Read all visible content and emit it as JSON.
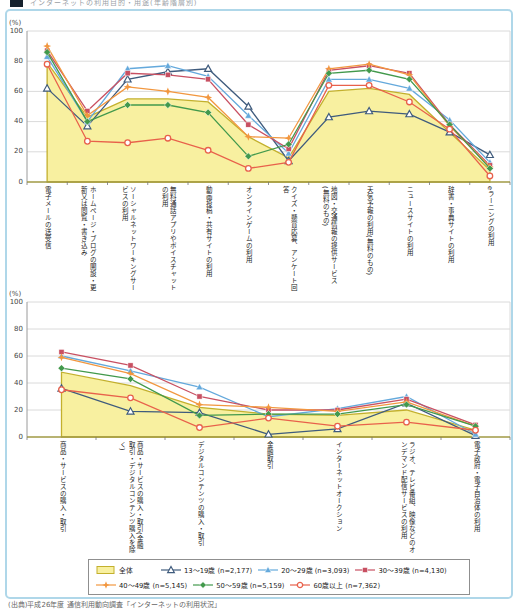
{
  "header": {
    "text": "インターネットの利用目的・用途(年齢階層別)"
  },
  "charts": {
    "percent_label": "(%)",
    "y_ticks": [
      0,
      20,
      40,
      60,
      80,
      100
    ]
  },
  "chart_data": [
    {
      "type": "area",
      "title": "インターネットの利用目的・用途(上段)",
      "ylabel": "(%)",
      "ylim": [
        0,
        100
      ],
      "grid": true,
      "categories": [
        "電子メールの送受信",
        "ホームページ・ブログの開設・更新又は閲覧・書き込み",
        "ソーシャルネットワーキングサービスの利用",
        "無料通話アプリやボイスチャットの利用",
        "動画投稿・共有サイトの利用",
        "オンラインゲームの利用",
        "クイズ・懸賞応募、アンケート回答",
        "地図・交通情報の提供サービス(無料のもの)",
        "天気予報の利用(無料のもの)",
        "ニュースサイトの利用",
        "辞書・事典サイトの利用",
        "eラーニングの利用"
      ],
      "series": [
        {
          "name": "全体",
          "marker": "area",
          "color": "#f8f0a0",
          "edge": "#c3b02d",
          "values": [
            79,
            43,
            55,
            55,
            53,
            30,
            16,
            60,
            62,
            58,
            33,
            8
          ]
        },
        {
          "name": "13〜19歳 (n=2,177)",
          "marker": "triangle-open",
          "color": "#3f5b7d",
          "values": [
            62,
            37,
            68,
            73,
            75,
            50,
            14,
            43,
            47,
            45,
            33,
            18
          ]
        },
        {
          "name": "20〜29歳 (n=3,093)",
          "marker": "triangle-filled",
          "color": "#64a9dc",
          "values": [
            83,
            40,
            75,
            77,
            70,
            44,
            19,
            68,
            68,
            62,
            41,
            13
          ]
        },
        {
          "name": "30〜39歳 (n=4,130)",
          "marker": "square-filled",
          "color": "#c85062",
          "values": [
            87,
            47,
            72,
            71,
            68,
            38,
            22,
            74,
            77,
            72,
            38,
            11
          ]
        },
        {
          "name": "40〜49歳 (n=5,145)",
          "marker": "star4",
          "color": "#f2973f",
          "values": [
            90,
            44,
            63,
            60,
            56,
            30,
            29,
            75,
            78,
            71,
            37,
            10
          ]
        },
        {
          "name": "50〜59歳 (n=5,159)",
          "marker": "diamond-filled",
          "color": "#42994c",
          "values": [
            86,
            40,
            51,
            51,
            46,
            17,
            25,
            72,
            74,
            68,
            38,
            9
          ]
        },
        {
          "name": "60歳以上 (n=7,362)",
          "marker": "circle-open",
          "color": "#e8614b",
          "values": [
            78,
            27,
            26,
            29,
            21,
            9,
            13,
            64,
            64,
            53,
            35,
            4
          ]
        }
      ]
    },
    {
      "type": "area",
      "title": "インターネットの利用目的・用途(下段)",
      "ylabel": "(%)",
      "ylim": [
        0,
        100
      ],
      "grid": true,
      "categories": [
        "商品・サービスの購入・取引",
        "商品・サービスの購入・取引(金融取引・デジタルコンテンツ購入を除く)",
        "デジタルコンテンツの購入・取引",
        "金融取引",
        "インターネットオークション",
        "ラジオ、テレビ番組、映像などのオンデマンド配信サービスの利用",
        "電子政府・電子自治体の利用"
      ],
      "series": [
        {
          "name": "全体",
          "marker": "area",
          "color": "#f8f0a0",
          "edge": "#c3b02d",
          "values": [
            48,
            38,
            22,
            17,
            16,
            20,
            5
          ]
        },
        {
          "name": "13〜19歳 (n=2,177)",
          "marker": "triangle-open",
          "color": "#3f5b7d",
          "values": [
            36,
            19,
            18,
            2,
            6,
            25,
            1
          ]
        },
        {
          "name": "20〜29歳 (n=3,093)",
          "marker": "triangle-filled",
          "color": "#64a9dc",
          "values": [
            60,
            49,
            37,
            15,
            21,
            30,
            2
          ]
        },
        {
          "name": "30〜39歳 (n=4,130)",
          "marker": "square-filled",
          "color": "#c85062",
          "values": [
            63,
            53,
            30,
            20,
            20,
            28,
            9
          ]
        },
        {
          "name": "40〜49歳 (n=5,145)",
          "marker": "star4",
          "color": "#f2973f",
          "values": [
            59,
            47,
            24,
            22,
            19,
            26,
            8
          ]
        },
        {
          "name": "50〜59歳 (n=5,159)",
          "marker": "diamond-filled",
          "color": "#42994c",
          "values": [
            51,
            43,
            16,
            17,
            17,
            24,
            8
          ]
        },
        {
          "name": "60歳以上 (n=7,362)",
          "marker": "circle-open",
          "color": "#e8614b",
          "values": [
            35,
            29,
            7,
            14,
            8,
            11,
            5
          ]
        }
      ]
    }
  ],
  "source": "(出典)平成26年度 通信利用動向調査「インターネットの利用状況」"
}
